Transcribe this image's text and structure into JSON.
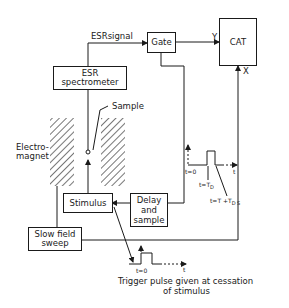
{
  "diagram": {
    "blocks": {
      "gate": "Gate",
      "cat": "CAT",
      "esr_spectrometer": [
        "ESR",
        "spectrometer"
      ],
      "stimulus": "Stimulus",
      "delay_and_sample": [
        "Delay",
        "and",
        "sample"
      ],
      "slow_field_sweep": [
        "Slow field",
        "sweep"
      ]
    },
    "labels": {
      "esr_signal": "ESRsignal",
      "y_input": "Y",
      "x_input": "X",
      "sample": "Sample",
      "electromagnet": [
        "Electro-",
        "magnet"
      ],
      "t0_upper": "t=0",
      "t_axis_upper": "t",
      "t_td": "t=T",
      "t_td_sub": "D",
      "t_tdts": "t=T +T",
      "t_tdts_sub": "D  S",
      "t0_lower": "t=0",
      "t_axis_lower": "t",
      "trigger_caption": [
        "Trigger pulse given at cessation",
        "of stimulus"
      ]
    },
    "colors": {
      "ink": "#1a1a1a",
      "background": "#ffffff"
    }
  }
}
